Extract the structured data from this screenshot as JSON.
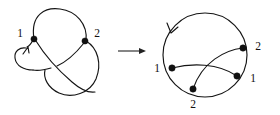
{
  "figure": {
    "width": 280,
    "height": 115,
    "background": "#ffffff",
    "ink_color": "#141414",
    "node_color": "#101010",
    "caption": "Knot diagram with two crossings transformed into its Gauss circle diagram"
  },
  "left_diagram": {
    "name": "knot-projection",
    "description": "Trefoil-style knot projection with two labelled crossings and an orientation arrow",
    "crossings": [
      {
        "id": "c1",
        "label": "1",
        "x": 34,
        "y": 39,
        "label_x": 20,
        "label_y": 34
      },
      {
        "id": "c2",
        "label": "2",
        "x": 85,
        "y": 41,
        "label_x": 95,
        "label_y": 34
      }
    ],
    "orientation_arrow": {
      "name": "orientation-arrow-left",
      "x": 28,
      "y": 48,
      "direction": "up-right"
    }
  },
  "transform_arrow": {
    "name": "transform-arrow",
    "label": "→",
    "x1": 118,
    "y1": 51,
    "x2": 146,
    "y2": 51
  },
  "right_diagram": {
    "name": "gauss-circle-diagram",
    "description": "Circle with four marked points joined by two crossing chords",
    "circle": {
      "cx": 205,
      "cy": 55,
      "r": 42
    },
    "nodes": [
      {
        "id": "n1",
        "label": "1",
        "x": 172,
        "y": 68,
        "label_x": 156,
        "label_y": 69,
        "anchor": "middle"
      },
      {
        "id": "n2",
        "label": "2",
        "x": 243,
        "y": 48,
        "label_x": 257,
        "label_y": 47,
        "anchor": "middle"
      },
      {
        "id": "n3",
        "label": "1",
        "x": 237,
        "y": 76,
        "label_x": 252,
        "label_y": 79,
        "anchor": "middle"
      },
      {
        "id": "n4",
        "label": "2",
        "x": 193,
        "y": 89,
        "label_x": 193,
        "label_y": 104,
        "anchor": "middle"
      }
    ],
    "chords": [
      {
        "id": "chord-1-1",
        "from": "n1",
        "to": "n3"
      },
      {
        "id": "chord-2-2",
        "from": "n2",
        "to": "n4"
      }
    ],
    "orientation_arrow": {
      "name": "orientation-arrow-right",
      "x": 172,
      "y": 31,
      "direction": "down-left"
    }
  }
}
